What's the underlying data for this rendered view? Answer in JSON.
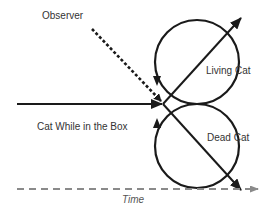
{
  "diagram": {
    "labels": {
      "observer": "Observer",
      "living_cat": "Living Cat",
      "dead_cat": "Dead Cat",
      "cat_in_box": "Cat While in the Box",
      "time": "Time"
    },
    "colors": {
      "stroke": "#1a1a1a",
      "time_axis": "#8a8a8a",
      "text": "#333333"
    },
    "nodes": [
      {
        "id": "cat-in-box",
        "label": "Cat While in the Box",
        "shape": "arrow"
      },
      {
        "id": "observer",
        "label": "Observer",
        "shape": "dashed-arrow"
      },
      {
        "id": "living-cat",
        "label": "Living Cat",
        "shape": "circle"
      },
      {
        "id": "dead-cat",
        "label": "Dead Cat",
        "shape": "circle"
      },
      {
        "id": "time",
        "label": "Time",
        "shape": "dashed-axis"
      }
    ],
    "edges": [
      {
        "from": "cat-in-box",
        "to": "branch-point",
        "style": "solid"
      },
      {
        "from": "observer",
        "to": "branch-point",
        "style": "dashed"
      },
      {
        "from": "branch-point",
        "to": "living-cat",
        "style": "solid"
      },
      {
        "from": "branch-point",
        "to": "dead-cat",
        "style": "solid"
      }
    ]
  }
}
